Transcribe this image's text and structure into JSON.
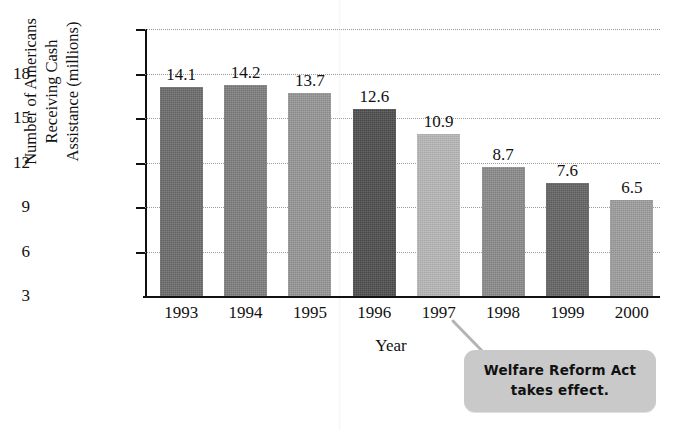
{
  "chart_data": {
    "type": "bar",
    "title": "",
    "xlabel": "Year",
    "ylabel": "Number of Americans Receiving Cash Assistance (millions)",
    "ylabel_lines": [
      "Number of Americans",
      "Receiving Cash",
      "Assistance (millions)"
    ],
    "categories": [
      "1993",
      "1994",
      "1995",
      "1996",
      "1997",
      "1998",
      "1999",
      "2000"
    ],
    "values": [
      14.1,
      14.2,
      13.7,
      12.6,
      10.9,
      8.7,
      7.6,
      6.5
    ],
    "value_labels": [
      "14.1",
      "14.2",
      "13.7",
      "12.6",
      "10.9",
      "8.7",
      "7.6",
      "6.5"
    ],
    "bar_colors": [
      "#6b6b6b",
      "#7d7d7d",
      "#949494",
      "#4d4d4d",
      "#b6b6b6",
      "#8a8a8a",
      "#636363",
      "#9c9c9c"
    ],
    "ylim": [
      0,
      18
    ],
    "yticks": [
      3,
      6,
      9,
      12,
      15,
      18
    ],
    "ytick_labels": [
      "3",
      "6",
      "9",
      "12",
      "15",
      "18"
    ],
    "grid": true,
    "grid_style": "dotted",
    "legend": false,
    "annotations": [
      {
        "text": "Welfare Reform Act takes effect.",
        "lines": [
          "Welfare Reform Act",
          "takes effect."
        ],
        "points_to": "1997"
      }
    ]
  },
  "colors": {
    "axis": "#111111",
    "grid": "#9a9a9a",
    "callout_bg": "#c9c9c9",
    "text": "#111111"
  }
}
